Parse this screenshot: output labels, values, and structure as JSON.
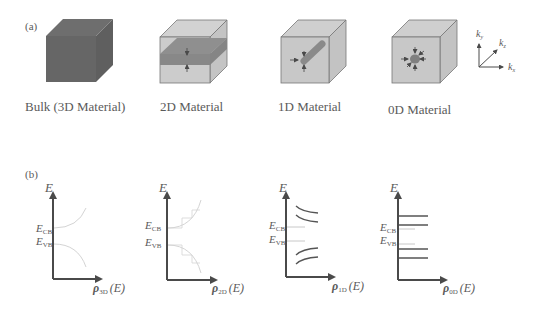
{
  "panel_a": {
    "label": "(a)",
    "materials": [
      {
        "id": "bulk",
        "label": "Bulk (3D Material)"
      },
      {
        "id": "2d",
        "label": "2D Material"
      },
      {
        "id": "1d",
        "label": "1D Material"
      },
      {
        "id": "0d",
        "label": "0D Material"
      }
    ],
    "axes": {
      "ky": "k",
      "ky_sub": "y",
      "kz": "k",
      "kz_sub": "z",
      "kx": "k",
      "kx_sub": "x"
    }
  },
  "panel_b": {
    "label": "(b)",
    "plots": [
      {
        "id": "3d",
        "yaxis": "E",
        "ecb": "E",
        "ecb_sub": "CB",
        "evb": "E",
        "evb_sub": "VB",
        "xaxis_rho": "ρ",
        "xaxis_sub": "3D",
        "xaxis_arg": "(E)"
      },
      {
        "id": "2d",
        "yaxis": "E",
        "ecb": "E",
        "ecb_sub": "CB",
        "evb": "E",
        "evb_sub": "VB",
        "xaxis_rho": "ρ",
        "xaxis_sub": "2D",
        "xaxis_arg": "(E)"
      },
      {
        "id": "1d",
        "yaxis": "E",
        "ecb": "E",
        "ecb_sub": "CB",
        "evb": "E",
        "evb_sub": "VB",
        "xaxis_rho": "ρ",
        "xaxis_sub": "1D",
        "xaxis_arg": "(E)"
      },
      {
        "id": "0d",
        "yaxis": "E",
        "ecb": "E",
        "ecb_sub": "CB",
        "evb": "E",
        "evb_sub": "VB",
        "xaxis_rho": "ρ",
        "xaxis_sub": "0D",
        "xaxis_arg": "(E)"
      }
    ]
  },
  "colors": {
    "bulk_cube": "#6b6b6b",
    "cube_light": "#c8c8c8",
    "slab": "#8a8a8a",
    "axis": "#4a4a4a",
    "curve_light": "#d4d4d4"
  }
}
